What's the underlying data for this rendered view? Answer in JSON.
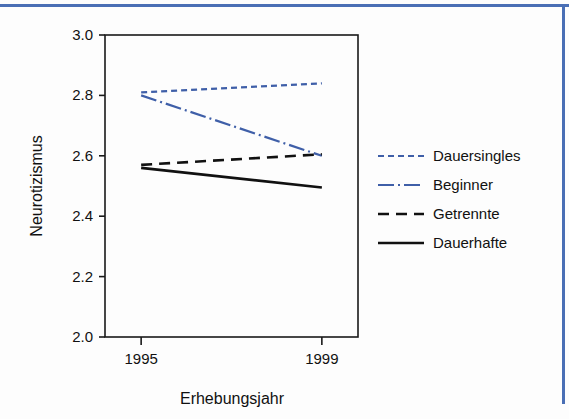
{
  "figure": {
    "border_color": "#4a6fb5",
    "background": "#fdfdfd",
    "plot_frame_color": "#1a1a1a"
  },
  "chart_data": {
    "type": "line",
    "title": "",
    "xlabel": "Erhebungsjahr",
    "ylabel": "Neurotizismus",
    "categories": [
      "1995",
      "1999"
    ],
    "x": [
      1995,
      1999
    ],
    "xtick_labels": [
      "1995",
      "1999"
    ],
    "ytick_labels": [
      "2.0",
      "2.2",
      "2.4",
      "2.6",
      "2.8",
      "3.0"
    ],
    "yticks": [
      2.0,
      2.2,
      2.4,
      2.6,
      2.8,
      3.0
    ],
    "ylim": [
      2.0,
      3.0
    ],
    "xlim": [
      1994.2,
      1999.8
    ],
    "grid": false,
    "legend_position": "right",
    "series": [
      {
        "name": "Dauersingles",
        "values": [
          2.81,
          2.84
        ],
        "color": "#3f5fa8",
        "dash": "dotted",
        "dasharray": "6,4",
        "width": 2.2
      },
      {
        "name": "Beginner",
        "values": [
          2.8,
          2.6
        ],
        "color": "#3f5fa8",
        "dash": "dash-dot",
        "dasharray": "16,4,2,4",
        "width": 2.2
      },
      {
        "name": "Getrennte",
        "values": [
          2.57,
          2.605
        ],
        "color": "#111111",
        "dash": "dashed",
        "dasharray": "11,7",
        "width": 2.6
      },
      {
        "name": "Dauerhafte",
        "values": [
          2.56,
          2.495
        ],
        "color": "#111111",
        "dash": "solid",
        "dasharray": "none",
        "width": 2.6
      }
    ]
  },
  "legend": {
    "entries": [
      {
        "label": "Dauersingles"
      },
      {
        "label": "Beginner"
      },
      {
        "label": "Getrennte"
      },
      {
        "label": "Dauerhafte"
      }
    ]
  }
}
